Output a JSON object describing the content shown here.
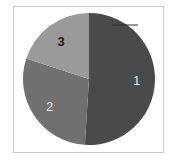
{
  "chart_data": {
    "type": "pie",
    "title": "",
    "categories": [
      "1",
      "2",
      "3"
    ],
    "values": [
      51,
      29,
      20
    ],
    "colors": [
      "#4a4a4a",
      "#707070",
      "#9a9a9a"
    ],
    "label_colors": [
      "#e6e6e6",
      "#e6e6e6",
      "#1a1a1a"
    ],
    "start_angle_deg": 0,
    "direction": "clockwise",
    "legend": "none",
    "frame": true
  }
}
